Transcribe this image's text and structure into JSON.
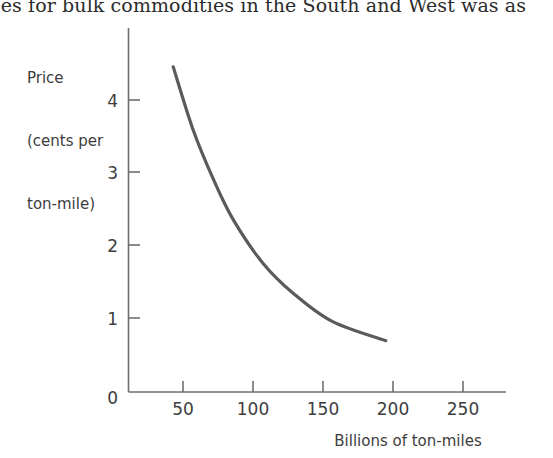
{
  "page": {
    "cropped_text_line": "ces for bulk commodities in the South and West was as"
  },
  "chart_data": {
    "type": "line",
    "title": "",
    "subtitle": "",
    "ylabel_lines": [
      "Price",
      "(cents per",
      "ton-mile)"
    ],
    "ylabel": "Price (cents per ton-mile)",
    "xlabel": "Billions of ton-miles",
    "xlim": [
      0,
      270
    ],
    "ylim": [
      0,
      4.4
    ],
    "xticks": [
      50,
      100,
      150,
      200,
      250
    ],
    "xtick_labels": [
      "50",
      "100",
      "150",
      "200",
      "250"
    ],
    "yticks": [
      0,
      1,
      2,
      3,
      4
    ],
    "ytick_labels": [
      "0",
      "1",
      "2",
      "3",
      "4"
    ],
    "grid": false,
    "legend": null,
    "series": [
      {
        "name": "Price vs volume",
        "color": "#5a5a5a",
        "x": [
          32,
          46,
          61,
          75,
          96,
          118,
          146,
          184
        ],
        "y": [
          3.93,
          3.18,
          2.56,
          2.08,
          1.56,
          1.19,
          0.85,
          0.62
        ]
      }
    ]
  }
}
